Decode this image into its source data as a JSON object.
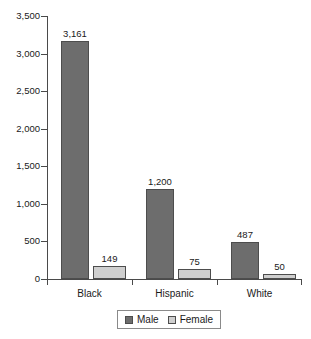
{
  "chart_data": {
    "type": "bar",
    "title": "",
    "subtitle": "",
    "xlabel": "",
    "ylabel": "",
    "categories": [
      "Black",
      "Hispanic",
      "White"
    ],
    "series": [
      {
        "name": "Male",
        "values": [
          3161,
          1200,
          487
        ],
        "labels": [
          "3,161",
          "1,200",
          "487"
        ],
        "color": "#6d6d6d"
      },
      {
        "name": "Female",
        "values": [
          149,
          75,
          50
        ],
        "labels": [
          "149",
          "75",
          "50"
        ],
        "color": "#cfcfcf"
      }
    ],
    "ylim": [
      0,
      3500
    ],
    "ytick_values": [
      0,
      500,
      1000,
      1500,
      2000,
      2500,
      3000,
      3500
    ],
    "ytick_labels": [
      "0",
      "500",
      "1,000",
      "1,500",
      "2,000",
      "2,500",
      "3,000",
      "3,500"
    ],
    "grid": false,
    "legend_position": "bottom",
    "legend_entries": [
      "Male",
      "Female"
    ],
    "value_labels_shown": true
  },
  "axes": {
    "y_axis_name": "y-axis",
    "x_axis_name": "x-axis"
  },
  "legend": {
    "items": [
      {
        "label": "Male",
        "swatch": "male-swatch"
      },
      {
        "label": "Female",
        "swatch": "female-swatch"
      }
    ]
  }
}
